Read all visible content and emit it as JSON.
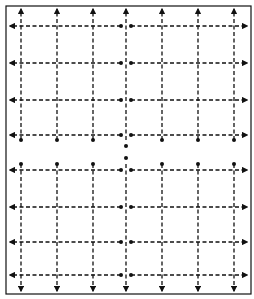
{
  "diagram": {
    "type": "grid-flow-diagram",
    "frame": {
      "x": 6,
      "y": 6,
      "width": 245,
      "height": 288
    },
    "stroke_color": "#111111",
    "background": "#ffffff",
    "columns_x": [
      21,
      57,
      93,
      126,
      162,
      198,
      234
    ],
    "rows_y": [
      26,
      63,
      100,
      135,
      170,
      207,
      242,
      275
    ],
    "center_x": 126,
    "center_row_y": 152
  }
}
